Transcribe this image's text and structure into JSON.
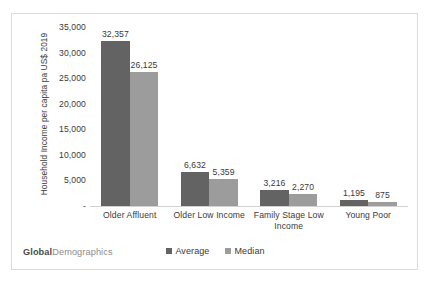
{
  "chart_data": {
    "type": "bar",
    "title": "",
    "xlabel": "",
    "ylabel": "Household Income per capita pa US$ 2019",
    "ylim": [
      0,
      35000
    ],
    "ytick_labels": [
      "35,000",
      "30,000",
      "25,000",
      "20,000",
      "15,000",
      "10,000",
      "5,000",
      "-"
    ],
    "ytick_values": [
      35000,
      30000,
      25000,
      20000,
      15000,
      10000,
      5000,
      0
    ],
    "grid": false,
    "legend_position": "bottom",
    "categories": [
      "Older Affluent",
      "Older Low Income",
      "Family Stage Low Income",
      "Young Poor"
    ],
    "series": [
      {
        "name": "Average",
        "color": "#636363",
        "values": [
          32357,
          6632,
          3216,
          1195
        ],
        "labels": [
          "32,357",
          "6,632",
          "3,216",
          "1,195"
        ]
      },
      {
        "name": "Median",
        "color": "#9c9c9c",
        "values": [
          26125,
          5359,
          2270,
          875
        ],
        "labels": [
          "26,125",
          "5,359",
          "2,270",
          "875"
        ]
      }
    ]
  },
  "brand": {
    "part1": "Global",
    "part2": "Demographics"
  }
}
